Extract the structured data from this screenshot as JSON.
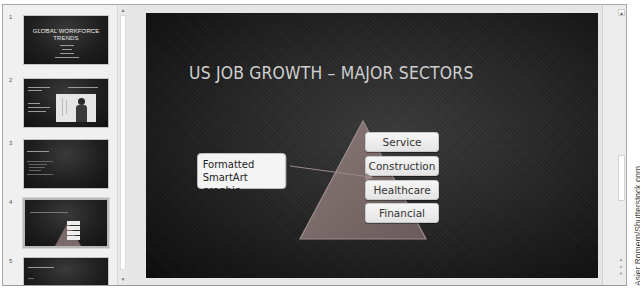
{
  "thumbnails": [
    {
      "number": "1",
      "title": "GLOBAL WORKFORCE TRENDS",
      "title_line1": "GLOBAL WORKFORCE",
      "title_line2": "TRENDS",
      "selected": false
    },
    {
      "number": "2",
      "title": "GLOBALIZATION / CONSEQUENCES",
      "has_image": true,
      "selected": false
    },
    {
      "number": "3",
      "title": "BUSINESS ISSUES",
      "selected": false
    },
    {
      "number": "4",
      "title": "US JOB GROWTH – MAJOR SECTORS",
      "selected": true
    },
    {
      "number": "5",
      "title": "NEW SKILLS REQUIRED",
      "selected": false
    }
  ],
  "slide": {
    "title": "US JOB GROWTH – MAJOR SECTORS",
    "smartart": {
      "type": "pyramid-list",
      "items": [
        "Service",
        "Construction",
        "Healthcare",
        "Financial"
      ]
    },
    "callout": {
      "line1": "Formatted",
      "line2": "SmartArt graphic"
    }
  },
  "scrollbars": {
    "thumb_up": "▲",
    "thumb_down": "▼",
    "main_up": "▲",
    "nav_prev": "▲",
    "nav_mid": "●",
    "nav_next": "▼"
  },
  "credit": "Asier Romero/Shutterstock.com",
  "colors": {
    "slide_bg": "#1e1e1e",
    "title_text": "#cfcfcf",
    "pyramid_fill": "#7a6a6a",
    "box_fill": "#f2f2f2"
  }
}
